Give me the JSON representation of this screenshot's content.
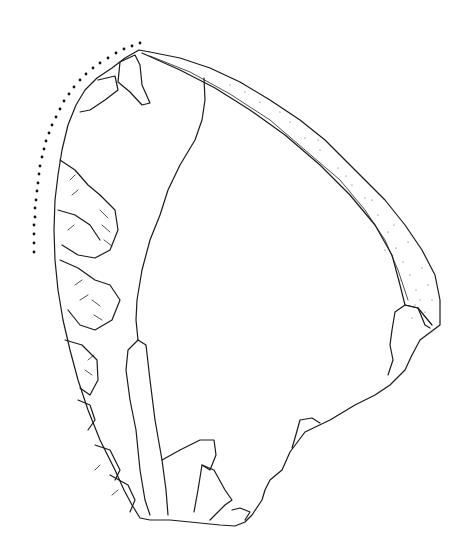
{
  "figure": {
    "subject": "lithic artifact line drawing",
    "colors": {
      "ink": "#1a1a1a",
      "background": "#ffffff",
      "stipple": "#555555"
    },
    "elements": {
      "dotted_arc": "retouched-edge-marker",
      "cortex_band": "stippled-cortex",
      "scars": "flake-removal-scars"
    }
  }
}
